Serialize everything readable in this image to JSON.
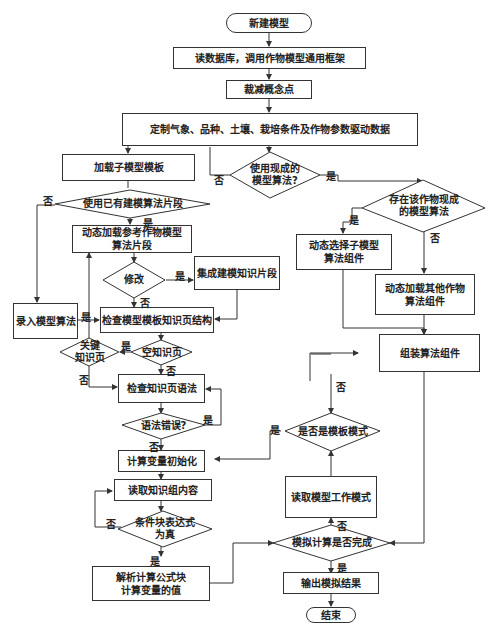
{
  "nodes": {
    "start": "新建模型",
    "read_db": "读数据库，调用作物模型通用框架",
    "cut_concepts": "裁减概念点",
    "customize": "定制气象、品种、土壤、栽培条件及作物参数驱动数据",
    "load_template": "加载子模型模板",
    "use_existing_alg": "使用现成的\n模型算法?",
    "use_existing_fragment": "使用已有建模算法片段",
    "exists_crop_alg": "存在该作物现成\n的模型算法",
    "dyn_load_ref": "动态加载参考作物模型\n算法片段",
    "modify": "修改",
    "integrate": "集成建模知识片段",
    "dyn_select": "动态选择子模型\n算法组件",
    "dyn_load_other": "动态加载其他作物\n算法组件",
    "input_alg": "录入模型算法",
    "check_structure": "检查模型模板知识页结构",
    "key_page": "关键\n知识页",
    "empty_page": "空知识页",
    "assemble": "组装算法组件",
    "check_syntax": "检查知识页语法",
    "syntax_error": "语法错误?",
    "is_template_mode": "是否是模板模式",
    "init_vars": "计算变量初始化",
    "read_group": "读取知识组内容",
    "read_mode": "读取模型工作模式",
    "condition_true": "条件块表达式\n为真",
    "sim_done": "模拟计算是否完成",
    "parse_formula": "解析计算公式块\n计算变量的值",
    "output": "输出模拟结果",
    "end": "结束"
  },
  "labels": {
    "yes": "是",
    "no": "否"
  },
  "colors": {
    "line": "#333333",
    "background": "#ffffff"
  }
}
